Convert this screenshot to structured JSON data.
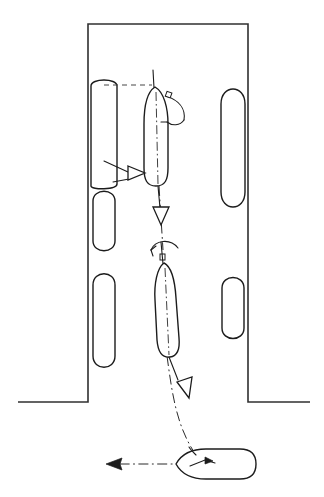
{
  "figure": {
    "type": "technical-line-diagram",
    "background_color": "#ffffff",
    "line_color": "#1c1c1c",
    "quay_color": "#303030",
    "width": 324,
    "height": 497
  },
  "harbour": {
    "name": "harbour-basin",
    "description": "Rectangular harbour basin open at the bottom with quay walls on left and right",
    "rect": {
      "x": 88,
      "y": 24,
      "width": 160,
      "height": 378
    },
    "left_wall_x": 88,
    "right_wall_x": 248,
    "top_wall_y": 24,
    "basin_mouth_y": 402,
    "left_apron_end_x": 18,
    "right_apron_end_x": 310
  },
  "moored_vessels": [
    {
      "name": "moored-vessel-left-1",
      "side": "left",
      "cx": 104,
      "cy": 135,
      "rx": 13,
      "ry": 52
    },
    {
      "name": "moored-vessel-left-2",
      "side": "left",
      "cx": 104,
      "cy": 221,
      "rx": 11,
      "ry": 31
    },
    {
      "name": "moored-vessel-left-3",
      "side": "left",
      "cx": 104,
      "cy": 321,
      "rx": 11,
      "ry": 49
    },
    {
      "name": "moored-vessel-right-1",
      "side": "right",
      "cx": 233,
      "cy": 147,
      "rx": 12,
      "ry": 63
    },
    {
      "name": "moored-vessel-right-2",
      "side": "right",
      "cx": 233,
      "cy": 308,
      "rx": 11,
      "ry": 32
    }
  ],
  "manoeuvring_ship": {
    "positions": [
      {
        "name": "ship-position-1-upper",
        "label": "upper position alongside berth",
        "cx": 156,
        "cy": 135,
        "rx": 12,
        "ry": 48,
        "heading_deg": 0,
        "has_centerline": true,
        "has_bow_mast": true
      },
      {
        "name": "ship-position-2-middle",
        "label": "middle position in basin",
        "cx": 167,
        "cy": 308,
        "rx": 12,
        "ry": 47,
        "heading_deg": 0,
        "has_centerline": true,
        "has_bow_mast": true
      },
      {
        "name": "ship-position-3-outside",
        "label": "final position outside harbour, heading to port",
        "cx": 212,
        "cy": 464,
        "rx": 42,
        "ry": 16,
        "heading_deg": 270,
        "has_centerline": true,
        "has_bow_mast": false
      }
    ]
  },
  "annotations": {
    "dashed_leader": {
      "name": "alignment-leader-dashed",
      "description": "Dashed alignment line from moored vessel bow to manoeuvring ship bow",
      "x1": 104,
      "y1": 85,
      "x2": 150,
      "y2": 85
    },
    "rotation_arcs": [
      {
        "name": "rotation-arc-upper",
        "description": "Clockwise rotation / swing arc at upper ship bow with angle marker",
        "cx": 170,
        "cy": 100,
        "radius": 20,
        "marker": "square-node"
      },
      {
        "name": "rotation-arc-middle",
        "description": "Rotation / swing arc above middle ship with angle marker",
        "cx": 163,
        "cy": 248,
        "radius": 16,
        "marker": "square-node"
      }
    ],
    "force_arrows": [
      {
        "name": "lateral-push-arrow",
        "description": "Open triangular arrow pointing right (lateral tug push)",
        "style": "outline-triangle",
        "x": 137,
        "y": 172,
        "direction": "right"
      },
      {
        "name": "astern-arrow-upper",
        "description": "Open triangular arrow pointing down below upper ship",
        "style": "outline-triangle",
        "x": 161,
        "y": 215,
        "direction": "down"
      },
      {
        "name": "astern-arrow-lower",
        "description": "Open triangular arrow pointing down-right along the outbound track",
        "style": "outline-triangle",
        "x": 186,
        "y": 395,
        "direction": "down-right"
      },
      {
        "name": "departure-arrow",
        "description": "Solid dash-dot arrow pointing left, departure course",
        "style": "solid-arrow",
        "x": 108,
        "y": 464,
        "direction": "left"
      },
      {
        "name": "bow-thrust-arrow",
        "description": "Small solid arrow on final ship pointing right",
        "style": "small-solid-arrow",
        "x": 200,
        "y": 461,
        "direction": "right"
      }
    ],
    "track_line": {
      "name": "manoeuvre-track",
      "description": "Dash-dot track line from upper ship through basin mouth to final position",
      "style": "dash-dot"
    }
  }
}
